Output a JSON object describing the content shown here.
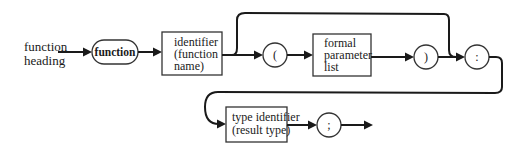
{
  "diagram": {
    "type": "syntax-diagram",
    "label": [
      "function",
      "heading"
    ],
    "nodes": {
      "keyword_function": {
        "text": "function",
        "shape": "rounded-terminal"
      },
      "identifier": {
        "lines": [
          "identifier",
          "(function",
          "name)"
        ],
        "shape": "box"
      },
      "open_paren": {
        "text": "(",
        "shape": "circle"
      },
      "formal_parameter_list": {
        "lines": [
          "formal",
          "parameter",
          "list"
        ],
        "shape": "box"
      },
      "close_paren": {
        "text": ")",
        "shape": "circle"
      },
      "colon": {
        "text": ":",
        "shape": "circle"
      },
      "type_identifier": {
        "lines": [
          "type identifier",
          "(result type)"
        ],
        "shape": "box"
      },
      "semicolon": {
        "text": ";",
        "shape": "circle"
      }
    },
    "edges": [
      [
        "label",
        "keyword_function"
      ],
      [
        "keyword_function",
        "identifier"
      ],
      [
        "identifier",
        "open_paren"
      ],
      [
        "identifier",
        "colon",
        "bypass-loop"
      ],
      [
        "open_paren",
        "formal_parameter_list"
      ],
      [
        "formal_parameter_list",
        "close_paren"
      ],
      [
        "close_paren",
        "colon"
      ],
      [
        "colon",
        "type_identifier",
        "wrap-loop"
      ],
      [
        "type_identifier",
        "semicolon"
      ],
      [
        "semicolon",
        "exit"
      ]
    ]
  }
}
